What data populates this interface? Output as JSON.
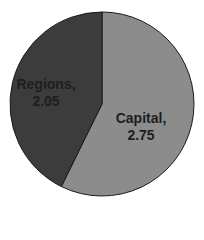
{
  "chart_data": {
    "type": "pie",
    "title": "",
    "categories": [
      "Capital",
      "Regions"
    ],
    "values": [
      2.75,
      2.05
    ],
    "colors": [
      "#8c8c8c",
      "#3c3c3c"
    ],
    "labels": [
      {
        "name": "Capital,",
        "value": "2.75"
      },
      {
        "name": "Regions,",
        "value": "2.05"
      }
    ],
    "start_angle_deg": 0,
    "direction": "clockwise",
    "legend": "none"
  }
}
